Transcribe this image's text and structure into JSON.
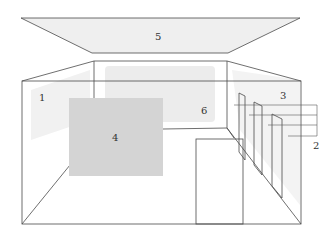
{
  "diagram": {
    "type": "room-schematic",
    "labels": {
      "ceiling": "5",
      "left_wall": "1",
      "right_wall": "3",
      "panel": "4",
      "back_wall": "6",
      "callout": "2"
    },
    "colors": {
      "line": "#4a4a4a",
      "panel_fill": "#d4d4d4",
      "shade_light": "#f0f0f0",
      "shade_mid": "#ebebeb",
      "background": "#ffffff"
    }
  }
}
